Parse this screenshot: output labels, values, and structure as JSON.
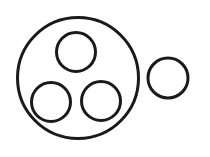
{
  "canvas": {
    "width": 210,
    "height": 157,
    "background_color": "#ffffff"
  },
  "style": {
    "stroke_color": "#1a1a1a",
    "stroke_width": 3,
    "fill": "none"
  },
  "diagram": {
    "shape_count": 5,
    "shapes": [
      {
        "name": "outer-large-circle",
        "type": "circle",
        "cx": 78,
        "cy": 78,
        "r": 60.5,
        "diameter": 121,
        "stroke_width": 3,
        "stroke_color": "#1a1a1a",
        "fill": "none",
        "group": "main-cluster"
      },
      {
        "name": "inner-top-circle",
        "type": "circle",
        "cx": 76,
        "cy": 52,
        "r": 19.5,
        "diameter": 39,
        "stroke_width": 3,
        "stroke_color": "#1a1a1a",
        "fill": "none",
        "group": "main-cluster"
      },
      {
        "name": "inner-bottom-left-circle",
        "type": "circle",
        "cx": 51,
        "cy": 102,
        "r": 19.5,
        "diameter": 39,
        "stroke_width": 3,
        "stroke_color": "#1a1a1a",
        "fill": "none",
        "group": "main-cluster"
      },
      {
        "name": "inner-bottom-right-circle",
        "type": "circle",
        "cx": 101,
        "cy": 101,
        "r": 19.5,
        "diameter": 39,
        "stroke_width": 3,
        "stroke_color": "#1a1a1a",
        "fill": "none",
        "group": "main-cluster"
      },
      {
        "name": "separate-small-circle",
        "type": "circle",
        "cx": 168,
        "cy": 78,
        "r": 20,
        "diameter": 40,
        "stroke_width": 3,
        "stroke_color": "#1a1a1a",
        "fill": "none",
        "group": "standalone"
      }
    ]
  }
}
